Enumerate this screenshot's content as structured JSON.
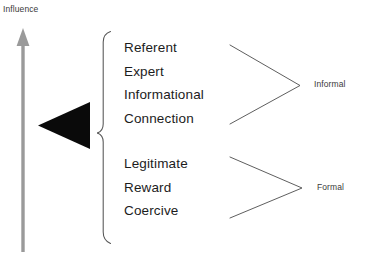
{
  "diagram": {
    "axis": {
      "label": "Influence",
      "direction": "upward",
      "arrow_color": "#9a9a9a",
      "icon": "up-arrow-icon"
    },
    "wedge": {
      "icon": "left-triangle-icon",
      "color": "#0a0a0a"
    },
    "brace": {
      "icon": "curly-brace-icon",
      "color": "#555555"
    },
    "groups": [
      {
        "key": "informal",
        "category": "Informal",
        "items": [
          "Referent",
          "Expert",
          "Informational",
          "Connection"
        ]
      },
      {
        "key": "formal",
        "category": "Formal",
        "items": [
          "Legitimate",
          "Reward",
          "Coercive"
        ]
      }
    ],
    "connector": {
      "icon": "converging-lines-icon",
      "color": "#555555"
    },
    "colors": {
      "background": "#ffffff",
      "text": "#1c1c1c",
      "small_text": "#3a3a3a",
      "line": "#555555",
      "arrow": "#9a9a9a",
      "wedge": "#0a0a0a"
    }
  }
}
